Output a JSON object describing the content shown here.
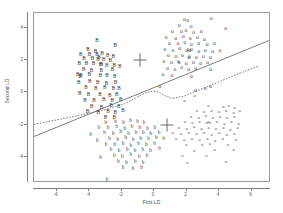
{
  "chart_data": {
    "type": "scatter",
    "title": "",
    "xlabel": "First LD",
    "ylabel": "Second LD",
    "xlim": [
      -7.4,
      7.2
    ],
    "ylim": [
      -5.6,
      4.9
    ],
    "xticks": [
      -6,
      -4,
      -2,
      0,
      2,
      4,
      6
    ],
    "xtick_labels": [
      "-6",
      "-4",
      "-2",
      "0",
      "2",
      "4",
      "6"
    ],
    "yticks": [
      4,
      2,
      0,
      -2,
      -4
    ],
    "ytick_labels": [
      "4",
      "2",
      "0",
      "-2",
      "-4"
    ],
    "grid": false,
    "legend": "none",
    "series": [
      {
        "name": "Group B",
        "marker": "B",
        "marker_class": "pt-B",
        "points": [
          [
            -3.52,
            3.16
          ],
          [
            -4.08,
            2.62
          ],
          [
            -3.62,
            2.52
          ],
          [
            -2.4,
            2.84
          ],
          [
            -4.52,
            2.28
          ],
          [
            -3.98,
            2.3
          ],
          [
            -3.52,
            2.3
          ],
          [
            -3.2,
            2.36
          ],
          [
            -2.86,
            2.26
          ],
          [
            -2.52,
            2.2
          ],
          [
            -4.32,
            2.06
          ],
          [
            -3.8,
            2.08
          ],
          [
            -3.46,
            2.02
          ],
          [
            -3.4,
            2.1
          ],
          [
            -3.1,
            1.98
          ],
          [
            -2.7,
            1.92
          ],
          [
            -4.62,
            1.74
          ],
          [
            -4.16,
            1.78
          ],
          [
            -3.74,
            1.72
          ],
          [
            -3.3,
            1.7
          ],
          [
            -3.24,
            1.66
          ],
          [
            -2.92,
            1.6
          ],
          [
            -2.46,
            1.62
          ],
          [
            -2.12,
            1.56
          ],
          [
            -4.34,
            1.4
          ],
          [
            -3.86,
            1.34
          ],
          [
            -3.26,
            1.3
          ],
          [
            -2.56,
            1.36
          ],
          [
            -4.7,
            1.04
          ],
          [
            -4.56,
            0.96
          ],
          [
            -4.5,
            1.0
          ],
          [
            -4.0,
            1.06
          ],
          [
            -3.3,
            0.98
          ],
          [
            -2.9,
            1.02
          ],
          [
            -2.42,
            0.94
          ],
          [
            -4.64,
            0.6
          ],
          [
            -3.96,
            0.62
          ],
          [
            -3.48,
            0.56
          ],
          [
            -2.94,
            0.52
          ],
          [
            -2.38,
            0.58
          ],
          [
            -4.2,
            0.26
          ],
          [
            -3.6,
            0.2
          ],
          [
            -3.04,
            0.24
          ],
          [
            -2.5,
            0.18
          ],
          [
            -2.16,
            0.22
          ],
          [
            -4.58,
            -0.12
          ],
          [
            -4.04,
            -0.18
          ],
          [
            -3.34,
            -0.16
          ],
          [
            -2.74,
            -0.22
          ],
          [
            -2.3,
            -0.14
          ],
          [
            -4.26,
            -0.52
          ],
          [
            -3.7,
            -0.56
          ],
          [
            -3.1,
            -0.48
          ],
          [
            -2.58,
            -0.54
          ],
          [
            -2.06,
            -0.46
          ],
          [
            -3.84,
            -0.9
          ],
          [
            -3.24,
            -0.94
          ],
          [
            -2.66,
            -0.86
          ],
          [
            -2.18,
            -0.92
          ],
          [
            -4.1,
            -1.24
          ],
          [
            -3.44,
            -1.28
          ],
          [
            -2.84,
            -1.2
          ],
          [
            -2.4,
            -1.26
          ],
          [
            -1.92,
            -1.18
          ],
          [
            -3.0,
            -1.56
          ],
          [
            -2.46,
            -1.6
          ]
        ]
      },
      {
        "name": "Group b",
        "marker": "b",
        "marker_class": "pt-b",
        "points": [
          [
            -2.98,
            -1.88
          ],
          [
            -2.38,
            -1.84
          ],
          [
            -1.88,
            -1.9
          ],
          [
            -1.46,
            -1.8
          ],
          [
            -1.02,
            -1.86
          ],
          [
            -0.62,
            -1.92
          ],
          [
            -3.4,
            -2.18
          ],
          [
            -2.84,
            -2.22
          ],
          [
            -2.3,
            -2.14
          ],
          [
            -1.8,
            -2.24
          ],
          [
            -1.36,
            -2.16
          ],
          [
            -0.88,
            -2.2
          ],
          [
            -0.4,
            -2.26
          ],
          [
            0.06,
            -2.18
          ],
          [
            -3.06,
            -2.52
          ],
          [
            -2.52,
            -2.56
          ],
          [
            -2.06,
            -2.48
          ],
          [
            -1.58,
            -2.58
          ],
          [
            -1.12,
            -2.5
          ],
          [
            -0.66,
            -2.54
          ],
          [
            -0.2,
            -2.6
          ],
          [
            0.3,
            -2.52
          ],
          [
            -2.74,
            -2.88
          ],
          [
            -2.24,
            -2.92
          ],
          [
            -1.74,
            -2.84
          ],
          [
            -1.28,
            -2.94
          ],
          [
            -0.82,
            -2.86
          ],
          [
            -0.34,
            -2.9
          ],
          [
            0.14,
            -2.82
          ],
          [
            0.6,
            -2.88
          ],
          [
            -3.9,
            -2.64
          ],
          [
            -3.5,
            -3.02
          ],
          [
            -2.96,
            -3.24
          ],
          [
            -2.42,
            -3.28
          ],
          [
            -1.92,
            -3.2
          ],
          [
            -1.44,
            -3.3
          ],
          [
            -0.96,
            -3.22
          ],
          [
            -0.48,
            -3.26
          ],
          [
            0.02,
            -3.18
          ],
          [
            -2.66,
            -3.58
          ],
          [
            -2.16,
            -3.62
          ],
          [
            -1.66,
            -3.54
          ],
          [
            -1.18,
            -3.64
          ],
          [
            -0.7,
            -3.56
          ],
          [
            -0.22,
            -3.6
          ],
          [
            0.34,
            -3.52
          ],
          [
            -2.46,
            -3.94
          ],
          [
            -1.96,
            -3.98
          ],
          [
            -1.44,
            -3.9
          ],
          [
            -0.92,
            -4.0
          ],
          [
            -0.44,
            -3.92
          ],
          [
            -3.3,
            -4.06
          ],
          [
            -2.2,
            -4.32
          ],
          [
            -1.7,
            -4.36
          ],
          [
            -1.16,
            -4.28
          ],
          [
            -0.68,
            -4.38
          ],
          [
            -1.92,
            -4.7
          ],
          [
            -1.3,
            -4.74
          ],
          [
            -0.78,
            -4.66
          ],
          [
            -2.9,
            -5.4
          ]
        ]
      },
      {
        "name": "Group O",
        "marker": "o",
        "marker_class": "pt-O",
        "points": [
          [
            1.86,
            4.46
          ],
          [
            2.06,
            4.4
          ],
          [
            3.52,
            4.52
          ],
          [
            1.54,
            4.1
          ],
          [
            2.28,
            4.06
          ],
          [
            4.4,
            3.94
          ],
          [
            1.12,
            3.74
          ],
          [
            1.68,
            3.7
          ],
          [
            1.96,
            3.76
          ],
          [
            2.44,
            3.64
          ],
          [
            2.92,
            3.7
          ],
          [
            0.74,
            3.38
          ],
          [
            1.32,
            3.32
          ],
          [
            1.8,
            3.4
          ],
          [
            2.22,
            3.28
          ],
          [
            2.66,
            3.34
          ],
          [
            3.1,
            3.26
          ],
          [
            0.94,
            3.0
          ],
          [
            1.46,
            2.96
          ],
          [
            1.9,
            3.04
          ],
          [
            2.3,
            2.92
          ],
          [
            2.74,
            2.98
          ],
          [
            3.26,
            2.9
          ],
          [
            3.72,
            2.96
          ],
          [
            0.66,
            2.62
          ],
          [
            1.16,
            2.58
          ],
          [
            1.58,
            2.66
          ],
          [
            2.02,
            2.54
          ],
          [
            2.1,
            2.6
          ],
          [
            2.2,
            2.56
          ],
          [
            2.3,
            2.62
          ],
          [
            2.74,
            2.5
          ],
          [
            3.14,
            2.56
          ],
          [
            3.6,
            2.48
          ],
          [
            4.06,
            2.54
          ],
          [
            0.88,
            2.24
          ],
          [
            1.34,
            2.18
          ],
          [
            1.74,
            2.26
          ],
          [
            2.14,
            2.14
          ],
          [
            2.18,
            2.2
          ],
          [
            2.6,
            2.12
          ],
          [
            3.04,
            2.18
          ],
          [
            3.46,
            2.1
          ],
          [
            0.6,
            1.86
          ],
          [
            1.06,
            1.8
          ],
          [
            1.5,
            1.88
          ],
          [
            1.54,
            1.82
          ],
          [
            1.98,
            1.76
          ],
          [
            2.42,
            1.84
          ],
          [
            2.86,
            1.72
          ],
          [
            3.3,
            1.8
          ],
          [
            0.82,
            1.46
          ],
          [
            1.28,
            1.4
          ],
          [
            1.7,
            1.48
          ],
          [
            2.12,
            1.36
          ],
          [
            2.56,
            1.44
          ],
          [
            3.48,
            1.38
          ],
          [
            0.54,
            1.08
          ],
          [
            1.1,
            1.02
          ],
          [
            2.3,
            0.96
          ],
          [
            0.36,
            0.3
          ],
          [
            2.54,
            0.1
          ],
          [
            3.14,
            0.22
          ],
          [
            3.46,
            0.36
          ]
        ]
      },
      {
        "name": "Group o",
        "marker": "o",
        "marker_class": "pt-o",
        "points": [
          [
            2.5,
            -0.22
          ],
          [
            1.88,
            -0.54
          ],
          [
            3.34,
            -0.86
          ],
          [
            4.26,
            -0.92
          ],
          [
            4.6,
            -0.84
          ],
          [
            4.96,
            -0.96
          ],
          [
            2.64,
            -1.16
          ],
          [
            3.08,
            -1.22
          ],
          [
            3.54,
            -1.14
          ],
          [
            4.0,
            -1.24
          ],
          [
            4.44,
            -1.16
          ],
          [
            4.9,
            -1.26
          ],
          [
            5.26,
            -1.18
          ],
          [
            2.28,
            -1.5
          ],
          [
            2.74,
            -1.56
          ],
          [
            3.18,
            -1.48
          ],
          [
            3.62,
            -1.58
          ],
          [
            4.06,
            -1.5
          ],
          [
            4.5,
            -1.6
          ],
          [
            4.94,
            -1.52
          ],
          [
            1.9,
            -1.84
          ],
          [
            2.36,
            -1.9
          ],
          [
            2.8,
            -1.82
          ],
          [
            3.24,
            -1.92
          ],
          [
            3.34,
            -1.86
          ],
          [
            3.44,
            -1.9
          ],
          [
            3.88,
            -1.84
          ],
          [
            4.32,
            -1.94
          ],
          [
            4.76,
            -1.86
          ],
          [
            5.2,
            -1.96
          ],
          [
            1.52,
            -2.18
          ],
          [
            2.0,
            -2.24
          ],
          [
            2.46,
            -2.16
          ],
          [
            2.92,
            -2.26
          ],
          [
            3.36,
            -2.18
          ],
          [
            3.8,
            -2.28
          ],
          [
            4.26,
            -2.2
          ],
          [
            4.7,
            -2.3
          ],
          [
            5.14,
            -2.22
          ],
          [
            1.14,
            -2.52
          ],
          [
            1.66,
            -2.58
          ],
          [
            2.14,
            -2.5
          ],
          [
            2.62,
            -2.6
          ],
          [
            3.08,
            -2.52
          ],
          [
            3.54,
            -2.62
          ],
          [
            4.0,
            -2.54
          ],
          [
            4.48,
            -2.64
          ],
          [
            4.94,
            -2.56
          ],
          [
            1.36,
            -2.88
          ],
          [
            1.84,
            -2.94
          ],
          [
            2.32,
            -2.86
          ],
          [
            2.8,
            -2.96
          ],
          [
            3.28,
            -2.88
          ],
          [
            3.76,
            -2.98
          ],
          [
            4.24,
            -2.9
          ],
          [
            5.04,
            -2.92
          ],
          [
            1.98,
            -3.24
          ],
          [
            2.96,
            -3.28
          ],
          [
            3.44,
            -3.2
          ],
          [
            4.54,
            -3.26
          ],
          [
            2.46,
            -3.6
          ],
          [
            3.72,
            -3.56
          ],
          [
            4.9,
            -3.58
          ],
          [
            1.74,
            -3.94
          ],
          [
            3.22,
            -3.96
          ],
          [
            2.04,
            -4.36
          ],
          [
            4.42,
            -4.3
          ]
        ]
      }
    ],
    "centroids": [
      {
        "name": "centroid-left",
        "x": -0.86,
        "y": 2.0
      },
      {
        "name": "centroid-right",
        "x": 0.8,
        "y": -2.0
      }
    ],
    "boundaries": [
      {
        "name": "solid-boundary",
        "style": "solid",
        "points": [
          [
            -7.4,
            -2.82
          ],
          [
            7.2,
            3.18
          ]
        ]
      },
      {
        "name": "dashed-boundary",
        "style": "dashed",
        "points": [
          [
            -7.4,
            -2.06
          ],
          [
            -5.2,
            -1.62
          ],
          [
            -3.2,
            -1.2
          ],
          [
            -1.8,
            -0.78
          ],
          [
            -1.0,
            -0.36
          ],
          [
            -0.4,
            -0.06
          ],
          [
            0.0,
            0.02
          ],
          [
            0.35,
            -0.04
          ],
          [
            0.75,
            -0.28
          ],
          [
            1.2,
            -0.44
          ],
          [
            1.9,
            -0.3
          ],
          [
            2.8,
            0.06
          ],
          [
            3.9,
            0.52
          ],
          [
            5.0,
            0.98
          ],
          [
            6.0,
            1.38
          ],
          [
            6.5,
            1.56
          ]
        ]
      }
    ]
  }
}
